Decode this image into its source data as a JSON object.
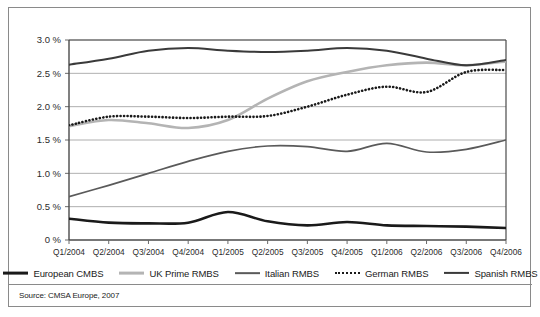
{
  "figure": {
    "source_note": "Source: CMSA Europe, 2007"
  },
  "chart_data": {
    "type": "line",
    "title": "",
    "xlabel": "",
    "ylabel": "",
    "ylim": [
      0,
      3.0
    ],
    "ytick_values": [
      3.0,
      2.5,
      2.0,
      1.5,
      1.0,
      0.5,
      0
    ],
    "ytick_labels": [
      "3.0 %",
      "2.5 %",
      "2.0 %",
      "1.5 %",
      "1.0 %",
      "0.5 %",
      "0 %"
    ],
    "grid": "horizontal",
    "legend_position": "bottom",
    "categories": [
      "Q1/2004",
      "Q2/2004",
      "Q3/2004",
      "Q4/2004",
      "Q1/2005",
      "Q2/2005",
      "Q3/2005",
      "Q4/2005",
      "Q1/2006",
      "Q2/2006",
      "Q3/2006",
      "Q4/2006"
    ],
    "series": [
      {
        "name": "European CMBS",
        "color": "#1a1a1a",
        "width": 2.6,
        "dash": "none",
        "values": [
          0.32,
          0.26,
          0.25,
          0.26,
          0.42,
          0.28,
          0.22,
          0.27,
          0.22,
          0.21,
          0.2,
          0.18
        ]
      },
      {
        "name": "UK Prime RMBS",
        "color": "#b4b4b4",
        "width": 2.6,
        "dash": "none",
        "values": [
          1.71,
          1.8,
          1.75,
          1.68,
          1.8,
          2.12,
          2.38,
          2.52,
          2.62,
          2.66,
          2.62,
          2.68
        ]
      },
      {
        "name": "Italian RMBS",
        "color": "#5a5a5a",
        "width": 1.7,
        "dash": "none",
        "values": [
          0.65,
          0.82,
          1.0,
          1.18,
          1.33,
          1.41,
          1.4,
          1.33,
          1.45,
          1.32,
          1.36,
          1.5
        ]
      },
      {
        "name": "German RMBS",
        "color": "#1a1a1a",
        "width": 2.6,
        "dash": "dotted",
        "values": [
          1.72,
          1.85,
          1.85,
          1.83,
          1.85,
          1.86,
          2.0,
          2.18,
          2.3,
          2.22,
          2.52,
          2.55
        ]
      },
      {
        "name": "Spanish RMBS",
        "color": "#3a3a3a",
        "width": 2.0,
        "dash": "none",
        "values": [
          2.63,
          2.72,
          2.84,
          2.88,
          2.84,
          2.82,
          2.84,
          2.88,
          2.84,
          2.72,
          2.62,
          2.7
        ]
      }
    ]
  },
  "legend": {
    "items": [
      {
        "label": "European CMBS",
        "color": "#1a1a1a",
        "style": "solid-thick"
      },
      {
        "label": "UK Prime RMBS",
        "color": "#b4b4b4",
        "style": "solid-thick"
      },
      {
        "label": "Italian RMBS",
        "color": "#5a5a5a",
        "style": "solid-thin"
      },
      {
        "label": "German RMBS",
        "color": "#1a1a1a",
        "style": "dotted"
      },
      {
        "label": "Spanish RMBS",
        "color": "#3a3a3a",
        "style": "solid-medium"
      }
    ]
  }
}
